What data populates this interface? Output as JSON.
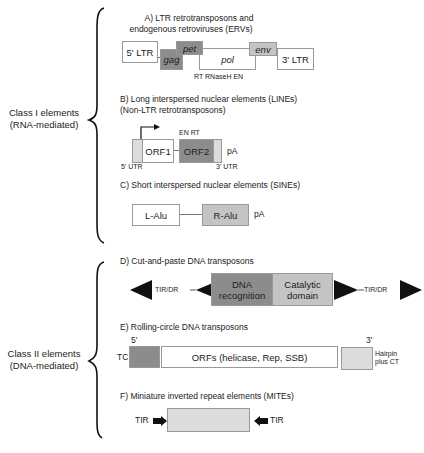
{
  "classes": [
    {
      "title": "Class I elements",
      "subtitle": "(RNA-mediated)"
    },
    {
      "title": "Class II elements",
      "subtitle": "(DNA-mediated)"
    }
  ],
  "sections": {
    "A": {
      "title_line1": "A) LTR retrotransposons and",
      "title_line2": "endogenous retroviruses (ERVs)",
      "boxes": {
        "ltr5": "5' LTR",
        "gag": "gag",
        "pet": "pet",
        "pol": "pol",
        "env": "env",
        "ltr3": "3' LTR"
      },
      "pol_domains": "RT RNaseH EN"
    },
    "B": {
      "title_line1": "B) Long interspersed nuclear elements (LINEs)",
      "title_line2": "(Non-LTR retrotransposons)",
      "boxes": {
        "orf1": "ORF1",
        "orf2": "ORF2"
      },
      "orf2_domains": "EN RT",
      "pa": "pA",
      "utr5": "5' UTR",
      "utr3": "3' UTR"
    },
    "C": {
      "title": "C) Short interspersed nuclear elements (SINEs)",
      "boxes": {
        "lalu": "L-Alu",
        "ralu": "R-Alu"
      },
      "pa": "pA"
    },
    "D": {
      "title": "D) Cut-and-paste DNA transposons",
      "boxes": {
        "dna_line1": "DNA",
        "dna_line2": "recognition",
        "cat_line1": "Catalytic",
        "cat_line2": "domain"
      },
      "tir_left": "TIR/DR",
      "tir_right": "TIR/DR"
    },
    "E": {
      "title": "E) Rolling-circle DNA transposons",
      "five_prime": "5'",
      "three_prime": "3'",
      "tc": "TC",
      "orfs": "ORFs (helicase, Rep, SSB)",
      "hairpin_line1": "Hairpin",
      "hairpin_line2": "plus CT"
    },
    "F": {
      "title": "F) Miniature inverted repeat elements (MITEs)",
      "tir_left": "TIR",
      "tir_right": "TIR"
    }
  },
  "colors": {
    "dark_gray": "#8c8c8c",
    "mid_gray": "#c4c4c4",
    "light_gray": "#dcdcdc",
    "border": "#999999"
  }
}
